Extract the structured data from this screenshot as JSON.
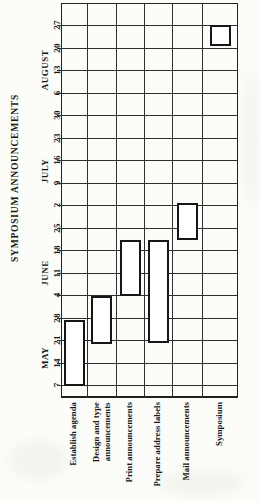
{
  "title": "SYMPOSIUM ANNOUNCEMENTS",
  "chart_data": {
    "type": "bar",
    "variant": "gantt-rotated-90",
    "title": "SYMPOSIUM ANNOUNCEMENTS",
    "orientation": "time axis vertical, reads bottom-to-top; tasks are columns left-to-right",
    "grid": "on",
    "time_axis": {
      "direction": "bottom-to-top",
      "tick_unit": "week",
      "months": [
        {
          "label": "MAY",
          "dates": [
            7,
            14,
            21,
            28
          ]
        },
        {
          "label": "JUNE",
          "dates": [
            4,
            11,
            18,
            25
          ]
        },
        {
          "label": "JULY",
          "dates": [
            2,
            9,
            16,
            23,
            30
          ]
        },
        {
          "label": "AUGUST",
          "dates": [
            6,
            13,
            20,
            27
          ]
        }
      ]
    },
    "tasks": [
      {
        "label": "Establish agenda",
        "lines": [
          "Establish agenda"
        ],
        "start": "MAY 7",
        "end": "MAY 28"
      },
      {
        "label": "Design and type announcements",
        "lines": [
          "Design and type",
          "announcements"
        ],
        "start": "MAY 21",
        "end": "JUNE 4"
      },
      {
        "label": "Print announcements",
        "lines": [
          "Print announcements"
        ],
        "start": "JUNE 4",
        "end": "JUNE 18"
      },
      {
        "label": "Prepare address labels",
        "lines": [
          "Prepare address labels"
        ],
        "start": "MAY 21",
        "end": "JUNE 18"
      },
      {
        "label": "Mail announcements",
        "lines": [
          "Mail announcements"
        ],
        "start": "JUNE 18",
        "end": "JULY 2"
      },
      {
        "label": "Symposium",
        "lines": [
          "Symposium"
        ],
        "start": "AUGUST 20",
        "end": "AUGUST 27"
      }
    ],
    "colors": {
      "background": "#fcfcf9",
      "line": "#2f2f2f",
      "bar_border": "#161616",
      "bar_fill": "#ffffff",
      "text": "#161616"
    }
  }
}
